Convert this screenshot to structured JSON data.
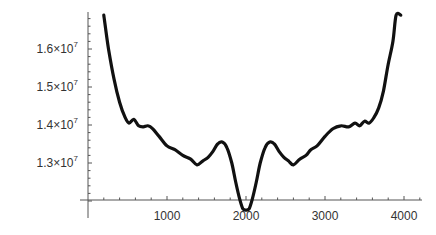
{
  "chart_data": {
    "type": "line",
    "title": "",
    "xlabel": "",
    "ylabel": "",
    "xlim": [
      0,
      4200
    ],
    "ylim": [
      12000000,
      16900000
    ],
    "grid": false,
    "legend": null,
    "x_ticks": [
      {
        "value": 1000,
        "label": "1000"
      },
      {
        "value": 2000,
        "label": "2000"
      },
      {
        "value": 3000,
        "label": "3000"
      },
      {
        "value": 4000,
        "label": "4000"
      }
    ],
    "y_ticks": [
      {
        "value": 13000000,
        "mantissa": "1.3",
        "exp": "7"
      },
      {
        "value": 14000000,
        "mantissa": "1.4",
        "exp": "7"
      },
      {
        "value": 15000000,
        "mantissa": "1.5",
        "exp": "7"
      },
      {
        "value": 16000000,
        "mantissa": "1.6",
        "exp": "7"
      }
    ],
    "series": [
      {
        "name": "curve",
        "color": "#111111",
        "x": [
          200,
          260,
          330,
          400,
          470,
          520,
          580,
          640,
          700,
          760,
          820,
          900,
          1000,
          1100,
          1200,
          1300,
          1380,
          1450,
          1520,
          1580,
          1640,
          1700,
          1760,
          1820,
          1870,
          1920,
          1960,
          2000,
          2040,
          2080,
          2130,
          2180,
          2240,
          2300,
          2360,
          2420,
          2480,
          2540,
          2600,
          2680,
          2760,
          2820,
          2900,
          3000,
          3100,
          3200,
          3300,
          3380,
          3440,
          3500,
          3560,
          3620,
          3680,
          3740,
          3800,
          3860,
          3900,
          3960
        ],
        "y": [
          16890000,
          16000000,
          15200000,
          14600000,
          14200000,
          14050000,
          14150000,
          13980000,
          13950000,
          13980000,
          13900000,
          13700000,
          13450000,
          13350000,
          13200000,
          13100000,
          12950000,
          13050000,
          13150000,
          13300000,
          13500000,
          13550000,
          13400000,
          13000000,
          12500000,
          12050000,
          11800000,
          11760000,
          11800000,
          12050000,
          12500000,
          13000000,
          13400000,
          13550000,
          13500000,
          13300000,
          13150000,
          13050000,
          12950000,
          13100000,
          13200000,
          13350000,
          13450000,
          13700000,
          13900000,
          13980000,
          13950000,
          14050000,
          13980000,
          14100000,
          14050000,
          14200000,
          14450000,
          14900000,
          15600000,
          16200000,
          16890000,
          16890000
        ]
      }
    ]
  }
}
